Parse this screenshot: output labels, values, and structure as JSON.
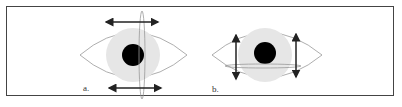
{
  "figure": {
    "panels": [
      {
        "id": "a",
        "label": "a.",
        "description": "Eye with vertical ellipse on pupil edge and horizontal arrows above and below"
      },
      {
        "id": "b",
        "label": "b.",
        "description": "Eye with horizontal ellipse below pupil and vertical arrows on left and right"
      }
    ],
    "colors": {
      "border": "#444444",
      "iris": "#e6e6e6",
      "pupil": "#000000",
      "outline": "#999999",
      "arrow": "#222222"
    }
  }
}
